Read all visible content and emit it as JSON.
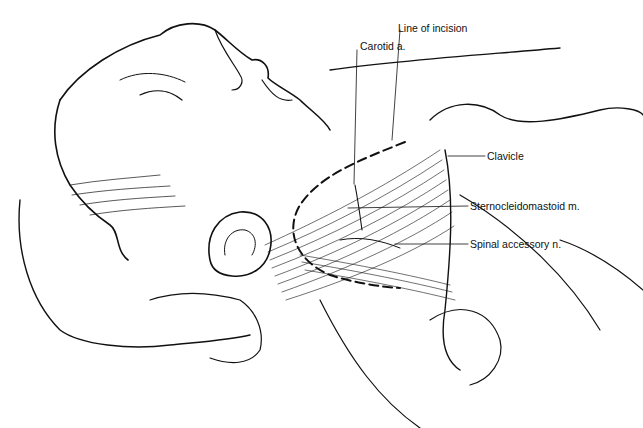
{
  "figure": {
    "labels": [
      {
        "id": "line-of-incision",
        "text": "Line of incision",
        "x": 398,
        "y": 22
      },
      {
        "id": "carotid-artery",
        "text": "Carotid a.",
        "x": 360,
        "y": 40
      },
      {
        "id": "clavicle",
        "text": "Clavicle",
        "x": 487,
        "y": 152
      },
      {
        "id": "sternocleidomastoid",
        "text": "Sternocleidomastoid m.",
        "x": 470,
        "y": 202
      },
      {
        "id": "spinal-accessory-nerve",
        "text": "Spinal accessory n.",
        "x": 470,
        "y": 239
      }
    ],
    "colors": {
      "ink": "#111111",
      "background": "#ffffff"
    }
  }
}
